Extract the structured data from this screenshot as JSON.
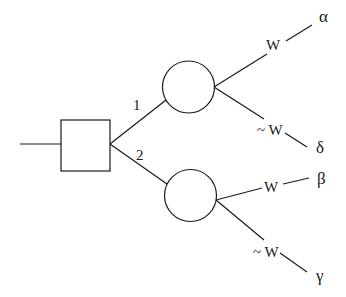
{
  "diagram": {
    "type": "decision-tree",
    "decision_node": {
      "shape": "square"
    },
    "branches": [
      {
        "label": "1",
        "chance_node": {
          "shape": "circle"
        },
        "outcomes": [
          {
            "condition": "W",
            "result": "α"
          },
          {
            "condition": "~ W",
            "result": "δ"
          }
        ]
      },
      {
        "label": "2",
        "chance_node": {
          "shape": "circle"
        },
        "outcomes": [
          {
            "condition": "W",
            "result": "β"
          },
          {
            "condition": "~ W",
            "result": "γ"
          }
        ]
      }
    ],
    "colors": {
      "stroke": "#1a1a1a",
      "background": "#ffffff"
    }
  }
}
